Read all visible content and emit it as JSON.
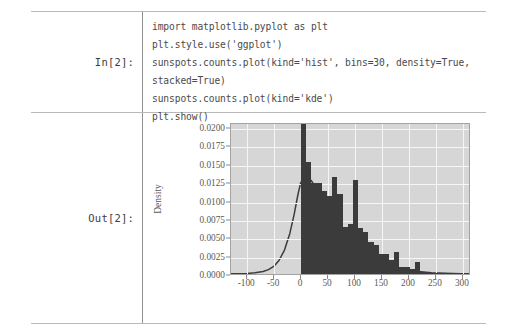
{
  "notebook": {
    "input": {
      "prompt": "In[2]:",
      "code_lines": [
        "import matplotlib.pyplot as plt",
        "plt.style.use('ggplot')",
        "sunspots.counts.plot(kind='hist', bins=30, density=True,",
        "stacked=True)",
        "sunspots.counts.plot(kind='kde')",
        "plt.show()"
      ]
    },
    "output": {
      "prompt": "Out[2]:"
    }
  },
  "chart_data": {
    "type": "bar",
    "title": "",
    "xlabel": "",
    "ylabel": "Density",
    "xlim": [
      -130,
      315
    ],
    "ylim": [
      0,
      0.0207
    ],
    "grid": true,
    "legend": false,
    "style": "ggplot",
    "plot_bgcolor": "#d6d6d6",
    "gridcolor": "#f6f6f6",
    "bar_color": "#3b3b3b",
    "kde_color": "#3b3b3b",
    "xticks": [
      -100,
      -50,
      0,
      50,
      100,
      150,
      200,
      250,
      300
    ],
    "xtick_labels": [
      "-100",
      "-50",
      "0",
      "50",
      "100",
      "150",
      "200",
      "250",
      "300"
    ],
    "yticks": [
      0.0,
      0.0025,
      0.005,
      0.0075,
      0.01,
      0.0125,
      0.015,
      0.0175,
      0.02
    ],
    "ytick_labels": [
      "0.0000",
      "0.0025",
      "0.0050",
      "0.0075",
      "0.0100",
      "0.0125",
      "0.0150",
      "0.0175",
      "0.0200"
    ],
    "histogram": {
      "bins": 30,
      "density": true,
      "bin_width": 9.6,
      "bin_left_edges": [
        0,
        9.6,
        19.2,
        28.8,
        38.4,
        48,
        57.6,
        67.2,
        76.8,
        86.4,
        96,
        105.6,
        115.2,
        124.8,
        134.4,
        144,
        153.6,
        163.2,
        172.8,
        182.4,
        192,
        201.6,
        211.2,
        220.8,
        230.4,
        240,
        249.6,
        259.2,
        268.8,
        278.4
      ],
      "values": [
        0.0205,
        0.0152,
        0.0124,
        0.0124,
        0.0113,
        0.0106,
        0.0132,
        0.0109,
        0.0064,
        0.0068,
        0.0128,
        0.0063,
        0.0057,
        0.0043,
        0.004,
        0.0027,
        0.0027,
        0.0019,
        0.003,
        0.001,
        0.0009,
        0.0007,
        0.0017,
        0.0003,
        0.0002,
        0.0002,
        0.0001,
        0.0001,
        0.0,
        0.0001
      ]
    },
    "kde": {
      "label": "kde",
      "x": [
        -130,
        -115,
        -100,
        -85,
        -70,
        -60,
        -50,
        -40,
        -30,
        -20,
        -12,
        -5,
        0,
        6,
        12,
        20,
        28,
        36,
        46,
        56,
        66,
        76,
        86,
        96,
        106,
        118,
        130,
        142,
        156,
        170,
        185,
        200,
        220,
        245,
        270,
        300,
        315
      ],
      "y": [
        2e-05,
        4e-05,
        8e-05,
        0.00016,
        0.00035,
        0.0006,
        0.00105,
        0.0019,
        0.0033,
        0.0056,
        0.0082,
        0.0109,
        0.0125,
        0.0133,
        0.0134,
        0.0129,
        0.012,
        0.011,
        0.0097,
        0.0084,
        0.0072,
        0.0061,
        0.0051,
        0.0043,
        0.0036,
        0.0029,
        0.0023,
        0.00185,
        0.0014,
        0.00105,
        0.00076,
        0.00056,
        0.00034,
        0.00018,
        0.0001,
        4e-05,
        3e-05
      ]
    }
  }
}
